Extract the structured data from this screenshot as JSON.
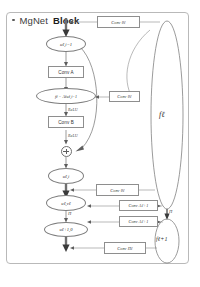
{
  "diagram": {
    "title": {
      "bullet": "bullet-dot",
      "text_light": "MgNet",
      "text_bold": "Block"
    },
    "nodes": {
      "u_prev": "uℓ,i−1",
      "residual": "fℓ − Aℓuℓ,i−1",
      "u_i": "uℓ,i",
      "u_ell_v": "uℓ,νℓ",
      "u_next": "uℓ+1,0",
      "f_ell": "fℓ",
      "f_next": "fℓ+1"
    },
    "boxes": {
      "conv_top": "Conv θℓ",
      "conv_a": "Conv A",
      "conv_mid": "Conv θℓ",
      "conv_b": "Conv B",
      "conv_uv": "Conv Πℓ",
      "conv_r1": "Conv θℓ",
      "conv_r2": "Conv Aℓ+1",
      "conv_r3": "Conv Aℓ+1"
    },
    "labels": {
      "relu_1": "ReLU",
      "relu_2": "ReLU",
      "pi_small": "Π",
      "pi_right": "Π"
    },
    "colors": {
      "frame": "#b9b9b9",
      "stroke": "#707070",
      "text": "#3a3a3a",
      "background": "#ffffff"
    }
  }
}
